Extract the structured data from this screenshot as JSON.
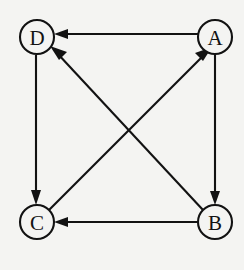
{
  "figure": {
    "background_color": "#f4f4f2",
    "line_color": "#121212",
    "node_fill_color": "#f4f4f2",
    "width": 244,
    "height": 270
  },
  "graph": {
    "type": "directed-graph",
    "node_radius": 17,
    "nodes": [
      {
        "id": "D",
        "label": "D",
        "cx": 37,
        "cy": 37
      },
      {
        "id": "A",
        "label": "A",
        "cx": 215,
        "cy": 37
      },
      {
        "id": "C",
        "label": "C",
        "cx": 37,
        "cy": 222
      },
      {
        "id": "B",
        "label": "B",
        "cx": 215,
        "cy": 222
      }
    ],
    "edges": [
      {
        "from": "A",
        "to": "D",
        "label": "A -> D",
        "style": "straight"
      },
      {
        "from": "A",
        "to": "B",
        "label": "A -> B",
        "style": "straight"
      },
      {
        "from": "B",
        "to": "C",
        "label": "B -> C",
        "style": "straight"
      },
      {
        "from": "B",
        "to": "D",
        "label": "B -> D",
        "style": "diagonal"
      },
      {
        "from": "C",
        "to": "A",
        "label": "C -> A",
        "style": "diagonal"
      },
      {
        "from": "D",
        "to": "C",
        "label": "D -> C",
        "style": "straight"
      }
    ]
  }
}
